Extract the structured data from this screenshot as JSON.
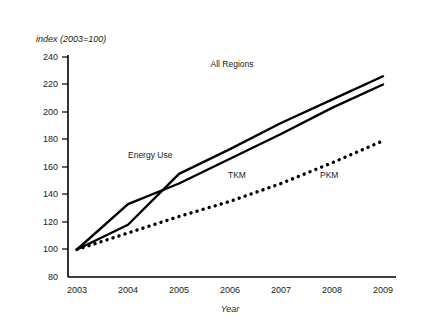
{
  "chart_data": {
    "type": "line",
    "title": "All Regions",
    "xlabel": "Year",
    "ylabel": "index (2003=100)",
    "xlim": [
      2003,
      2009
    ],
    "ylim": [
      80,
      240
    ],
    "xticks": [
      "2003",
      "2004",
      "2005",
      "2006",
      "2007",
      "2008",
      "2009"
    ],
    "yticks": [
      "80",
      "100",
      "120",
      "140",
      "160",
      "180",
      "200",
      "220",
      "240"
    ],
    "grid": false,
    "legend": "inline-annotations",
    "x": [
      2003,
      2004,
      2005,
      2006,
      2007,
      2008,
      2009
    ],
    "series": [
      {
        "name": "Energy Use",
        "style": "solid",
        "label": "Energy Use",
        "values": [
          100,
          118,
          155,
          173,
          192,
          209,
          226
        ]
      },
      {
        "name": "TKM",
        "style": "solid",
        "label": "TKM",
        "values": [
          100,
          133,
          148,
          166,
          184,
          203,
          220
        ]
      },
      {
        "name": "PKM",
        "style": "dotted",
        "label": "PKM",
        "values": [
          100,
          112,
          124,
          135,
          148,
          163,
          179
        ]
      }
    ],
    "annotations": [
      {
        "text": "All Regions",
        "x": 2006.0,
        "y": 232
      },
      {
        "text": "Energy Use",
        "x": 2004.3,
        "y": 172
      },
      {
        "text": "TKM",
        "x": 2005.6,
        "y": 157
      },
      {
        "text": "PKM",
        "x": 2007.5,
        "y": 157
      }
    ]
  },
  "axis": {
    "y_axis_label": "index (2003=100)",
    "x_axis_label": "Year"
  },
  "colors": {
    "line": "#000000",
    "axis": "#000000",
    "text": "#1a1a1a",
    "background": "#ffffff"
  }
}
